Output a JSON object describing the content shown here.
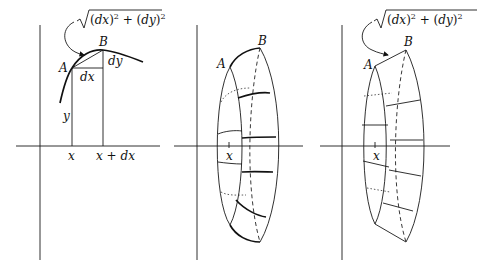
{
  "figure": {
    "panels": [
      {
        "id": "arc-element",
        "labels": {
          "point_a": "A",
          "point_b": "B",
          "dx": "dx",
          "dy": "dy",
          "y": "y",
          "x": "x",
          "x_plus_dx": "x + dx"
        },
        "formula": {
          "open": "(",
          "var1": "dx",
          "close1": ")",
          "exp1": "2",
          "plus": " + (",
          "var2": "dy",
          "close2": ")",
          "exp2": "2"
        }
      },
      {
        "id": "curved-band",
        "labels": {
          "point_a": "A",
          "point_b": "B",
          "x": "x"
        }
      },
      {
        "id": "frustum-band",
        "labels": {
          "point_a": "A",
          "point_b": "B",
          "x": "x"
        },
        "formula": {
          "open": "(",
          "var1": "dx",
          "close1": ")",
          "exp1": "2",
          "plus": " + (",
          "var2": "dy",
          "close2": ")",
          "exp2": "2"
        }
      }
    ]
  }
}
